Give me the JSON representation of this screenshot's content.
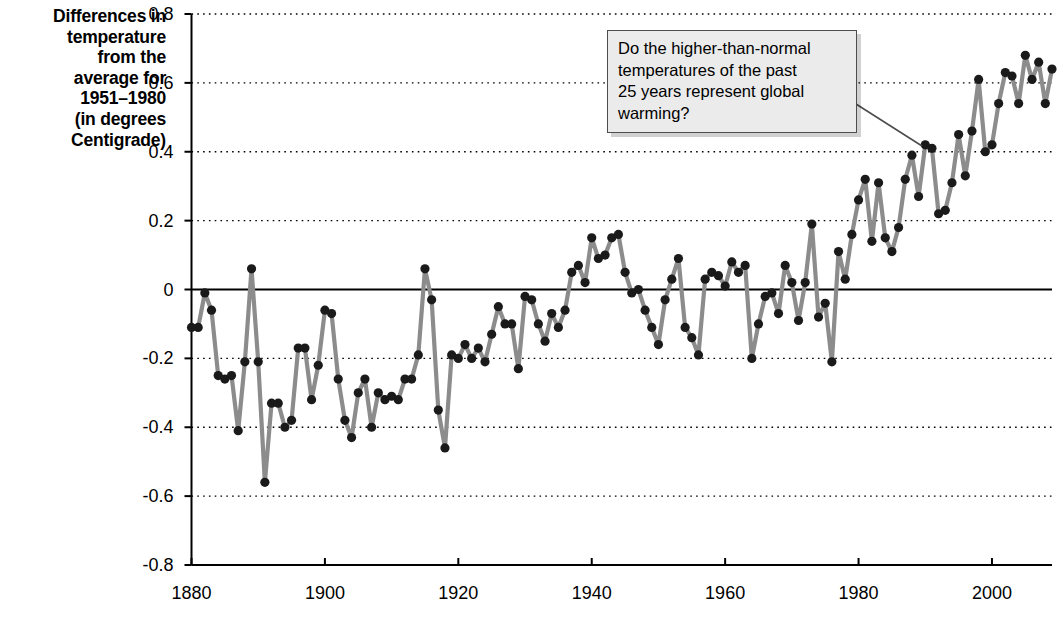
{
  "chart_data": {
    "type": "line",
    "title": "",
    "xlabel": "",
    "ylabel": "Differences in temperature from the average for 1951–1980 (in degrees Centigrade)",
    "ylim": [
      -0.8,
      0.8
    ],
    "xlim": [
      1880,
      2009
    ],
    "yticks": [
      "0.8",
      "0.6",
      "0.4",
      "0.2",
      "0",
      "-0.2",
      "-0.4",
      "-0.6",
      "-0.8"
    ],
    "ytick_values": [
      0.8,
      0.6,
      0.4,
      0.2,
      0,
      -0.2,
      -0.4,
      -0.6,
      -0.8
    ],
    "xticks": [
      "1880",
      "1900",
      "1920",
      "1940",
      "1960",
      "1980",
      "2000"
    ],
    "xtick_values": [
      1880,
      1900,
      1920,
      1940,
      1960,
      1980,
      2000
    ],
    "grid": "horizontal-dotted",
    "legend": "none",
    "marker": "filled-circle",
    "line_color": "#8c8c8c",
    "marker_color": "#1a1a1a",
    "series_name": "Global mean temperature anomaly",
    "x": [
      1880,
      1881,
      1882,
      1883,
      1884,
      1885,
      1886,
      1887,
      1888,
      1889,
      1890,
      1891,
      1892,
      1893,
      1894,
      1895,
      1896,
      1897,
      1898,
      1899,
      1900,
      1901,
      1902,
      1903,
      1904,
      1905,
      1906,
      1907,
      1908,
      1909,
      1910,
      1911,
      1912,
      1913,
      1914,
      1915,
      1916,
      1917,
      1918,
      1919,
      1920,
      1921,
      1922,
      1923,
      1924,
      1925,
      1926,
      1927,
      1928,
      1929,
      1930,
      1931,
      1932,
      1933,
      1934,
      1935,
      1936,
      1937,
      1938,
      1939,
      1940,
      1941,
      1942,
      1943,
      1944,
      1945,
      1946,
      1947,
      1948,
      1949,
      1950,
      1951,
      1952,
      1953,
      1954,
      1955,
      1956,
      1957,
      1958,
      1959,
      1960,
      1961,
      1962,
      1963,
      1964,
      1965,
      1966,
      1967,
      1968,
      1969,
      1970,
      1971,
      1972,
      1973,
      1974,
      1975,
      1976,
      1977,
      1978,
      1979,
      1980,
      1981,
      1982,
      1983,
      1984,
      1985,
      1986,
      1987,
      1988,
      1989,
      1990,
      1991,
      1992,
      1993,
      1994,
      1995,
      1996,
      1997,
      1998,
      1999,
      2000,
      2001,
      2002,
      2003,
      2004,
      2005,
      2006,
      2007,
      2008,
      2009
    ],
    "values": [
      -0.11,
      -0.11,
      -0.01,
      -0.06,
      -0.25,
      -0.26,
      -0.25,
      -0.41,
      -0.21,
      0.06,
      -0.21,
      -0.56,
      -0.33,
      -0.33,
      -0.4,
      -0.38,
      -0.17,
      -0.17,
      -0.32,
      -0.22,
      -0.06,
      -0.07,
      -0.26,
      -0.38,
      -0.43,
      -0.3,
      -0.26,
      -0.4,
      -0.3,
      -0.32,
      -0.31,
      -0.32,
      -0.26,
      -0.26,
      -0.19,
      0.06,
      -0.03,
      -0.35,
      -0.46,
      -0.19,
      -0.2,
      -0.16,
      -0.2,
      -0.17,
      -0.21,
      -0.13,
      -0.05,
      -0.1,
      -0.1,
      -0.23,
      -0.02,
      -0.03,
      -0.1,
      -0.15,
      -0.07,
      -0.11,
      -0.06,
      0.05,
      0.07,
      0.02,
      0.15,
      0.09,
      0.1,
      0.15,
      0.16,
      0.05,
      -0.01,
      0.0,
      -0.06,
      -0.11,
      -0.16,
      -0.03,
      0.03,
      0.09,
      -0.11,
      -0.14,
      -0.19,
      0.03,
      0.05,
      0.04,
      0.01,
      0.08,
      0.05,
      0.07,
      -0.2,
      -0.1,
      -0.02,
      -0.01,
      -0.07,
      0.07,
      0.02,
      -0.09,
      0.02,
      0.19,
      -0.08,
      -0.04,
      -0.21,
      0.11,
      0.03,
      0.16,
      0.26,
      0.32,
      0.14,
      0.31,
      0.15,
      0.11,
      0.18,
      0.32,
      0.39,
      0.27,
      0.42,
      0.41,
      0.22,
      0.23,
      0.31,
      0.45,
      0.33,
      0.46,
      0.61,
      0.4,
      0.42,
      0.54,
      0.63,
      0.62,
      0.54,
      0.68,
      0.61,
      0.66,
      0.54,
      0.64
    ],
    "annotations": [
      {
        "name": "global-warming-question",
        "text": "Do the higher-than-normal temperatures of the past 25 years represent global warming?",
        "lines": [
          "Do the higher-than-normal",
          "temperatures of the past",
          "25 years represent global",
          "warming?"
        ],
        "points_to_year": 1990
      }
    ]
  },
  "axis_label": {
    "lines": [
      "Differences in",
      "temperature",
      "from the",
      "average for",
      "1951–1980",
      "(in degrees",
      "Centigrade)"
    ]
  }
}
